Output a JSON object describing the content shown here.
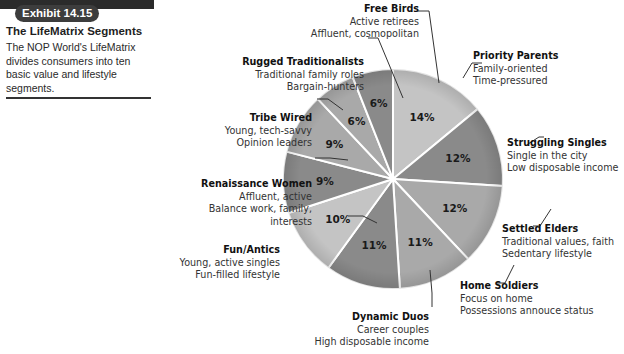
{
  "exhibit": {
    "badge": "Exhibit 14.15",
    "title": "The LifeMatrix Segments",
    "description": "The NOP World's LifeMatrix divides consumers into ten basic value and lifestyle segments."
  },
  "labels": [
    {
      "name": "Priority Parents",
      "lines": [
        "Family-oriented",
        "Time-pressured"
      ],
      "value": "14%"
    },
    {
      "name": "Struggling Singles",
      "lines": [
        "Single in the city",
        "Low disposable income"
      ],
      "value": "12%"
    },
    {
      "name": "Settled Elders",
      "lines": [
        "Traditional values, faith",
        "Sedentary lifestyle"
      ],
      "value": "12%"
    },
    {
      "name": "Home Soldiers",
      "lines": [
        "Focus on home",
        "Possessions annouce status"
      ],
      "value": "11%"
    },
    {
      "name": "Dynamic Duos",
      "lines": [
        "Career couples",
        "High disposable income"
      ],
      "value": "11%"
    },
    {
      "name": "Fun/Antics",
      "lines": [
        "Young, active singles",
        "Fun-filled lifestyle"
      ],
      "value": "10%"
    },
    {
      "name": "Renaissance Women",
      "lines": [
        "Affluent, active",
        "Balance work, family,",
        "interests"
      ],
      "value": "9%"
    },
    {
      "name": "Tribe Wired",
      "lines": [
        "Young, tech-savvy",
        "Opinion leaders"
      ],
      "value": "9%"
    },
    {
      "name": "Rugged Traditionalists",
      "lines": [
        "Traditional family roles",
        "Bargain-hunters"
      ],
      "value": "6%"
    },
    {
      "name": "Free Birds",
      "lines": [
        "Active retirees",
        "Affluent, cosmopolitan"
      ],
      "value": "6%"
    }
  ],
  "colors": {
    "badge_bg": "#3d3d3d",
    "slice_light": "#c4c4c4",
    "slice_mid": "#a9a9a9",
    "slice_dark": "#8a8a8a",
    "separator": "#ffffff"
  },
  "chart_data": {
    "type": "pie",
    "title": "The LifeMatrix Segments",
    "subtitle": "Exhibit 14.15",
    "start_angle": "12 o'clock",
    "direction": "clockwise",
    "categories": [
      "Priority Parents",
      "Struggling Singles",
      "Settled Elders",
      "Home Soldiers",
      "Dynamic Duos",
      "Fun/Antics",
      "Renaissance Women",
      "Tribe Wired",
      "Rugged Traditionalists",
      "Free Birds"
    ],
    "values": [
      14,
      12,
      12,
      11,
      11,
      10,
      9,
      9,
      6,
      6
    ],
    "unit": "%",
    "annotations": {
      "Priority Parents": [
        "Family-oriented",
        "Time-pressured"
      ],
      "Struggling Singles": [
        "Single in the city",
        "Low disposable income"
      ],
      "Settled Elders": [
        "Traditional values, faith",
        "Sedentary lifestyle"
      ],
      "Home Soldiers": [
        "Focus on home",
        "Possessions annouce status"
      ],
      "Dynamic Duos": [
        "Career couples",
        "High disposable income"
      ],
      "Fun/Antics": [
        "Young, active singles",
        "Fun-filled lifestyle"
      ],
      "Renaissance Women": [
        "Affluent, active",
        "Balance work, family,",
        "interests"
      ],
      "Tribe Wired": [
        "Young, tech-savvy",
        "Opinion leaders"
      ],
      "Rugged Traditionalists": [
        "Traditional family roles",
        "Bargain-hunters"
      ],
      "Free Birds": [
        "Active retirees",
        "Affluent, cosmopolitan"
      ]
    },
    "legend": "none (callout labels)"
  }
}
